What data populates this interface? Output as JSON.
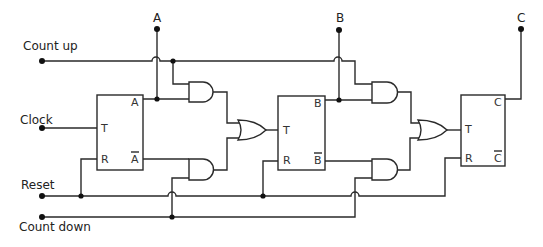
{
  "diagram": {
    "type": "logic-circuit",
    "colors": {
      "line": "#2a2a2a",
      "background": "#ffffff"
    },
    "inputs": {
      "count_up": "Count up",
      "clock": "Clock",
      "reset": "Reset",
      "count_down": "Count down"
    },
    "outputs": {
      "a": "A",
      "b": "B",
      "c": "C"
    },
    "flip_flops": [
      {
        "id": "ff-a",
        "t": "T",
        "r": "R",
        "q": "A",
        "qbar": "A"
      },
      {
        "id": "ff-b",
        "t": "T",
        "r": "R",
        "q": "B",
        "qbar": "B"
      },
      {
        "id": "ff-c",
        "t": "T",
        "r": "R",
        "q": "C",
        "qbar": "C"
      }
    ],
    "gates": [
      {
        "id": "and-1",
        "type": "AND"
      },
      {
        "id": "and-2",
        "type": "AND"
      },
      {
        "id": "or-1",
        "type": "OR"
      },
      {
        "id": "and-3",
        "type": "AND"
      },
      {
        "id": "and-4",
        "type": "AND"
      },
      {
        "id": "or-2",
        "type": "OR"
      }
    ]
  }
}
